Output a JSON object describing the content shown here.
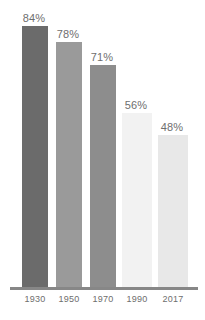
{
  "chart_data": {
    "type": "bar",
    "title": "",
    "subtitle": "",
    "xlabel": "",
    "ylabel": "",
    "ylim": [
      0,
      100
    ],
    "grid": false,
    "legend": "none",
    "categories": [
      "1930",
      "1950",
      "1970",
      "1990",
      "2017"
    ],
    "values": [
      84,
      78,
      71,
      56,
      48
    ],
    "data_labels": [
      "84%",
      "78%",
      "71%",
      "56%",
      "48%"
    ],
    "bar_colors": [
      "#6b6b6b",
      "#9a9a9a",
      "#8d8d8d",
      "#f2f2f2",
      "#e8e8e8"
    ],
    "series": [
      {
        "name": "",
        "values": [
          84,
          78,
          71,
          56,
          48
        ]
      }
    ],
    "axis_line_color": "#878787",
    "label_text_color": "#6e6e6e",
    "background_color": "#ffffff"
  },
  "bars": [
    {
      "category": "1930",
      "value": 84,
      "label": "84%",
      "color": "#6b6b6b",
      "left": 22,
      "width": 26,
      "height": 261
    },
    {
      "category": "1950",
      "value": 78,
      "label": "78%",
      "color": "#9a9a9a",
      "left": 56,
      "width": 26,
      "height": 245
    },
    {
      "category": "1970",
      "value": 71,
      "label": "71%",
      "color": "#8d8d8d",
      "left": 90,
      "width": 26,
      "height": 222
    },
    {
      "category": "1990",
      "value": 56,
      "label": "56%",
      "color": "#f2f2f2",
      "left": 122,
      "width": 30,
      "height": 174
    },
    {
      "category": "2017",
      "value": 48,
      "label": "48%",
      "color": "#e8e8e8",
      "left": 158,
      "width": 30,
      "height": 152
    }
  ],
  "x_ticks": [
    {
      "label": "1930",
      "left": 16,
      "width": 38
    },
    {
      "label": "1950",
      "left": 50,
      "width": 38
    },
    {
      "label": "1970",
      "left": 84,
      "width": 38
    },
    {
      "label": "1990",
      "left": 118,
      "width": 38
    },
    {
      "label": "2017",
      "left": 154,
      "width": 38
    }
  ]
}
